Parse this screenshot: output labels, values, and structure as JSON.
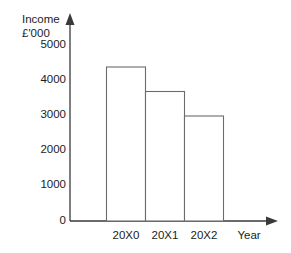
{
  "chart_data": {
    "type": "bar",
    "title": "",
    "subtitle": "",
    "xlabel": "Year",
    "ylabel": "Income",
    "ylabel_units": "£'000",
    "categories": [
      "20X0",
      "20X1",
      "20X2"
    ],
    "values": [
      4400,
      3700,
      3000
    ],
    "series": [
      {
        "name": "Income",
        "values": [
          4400,
          3700,
          3000
        ]
      }
    ],
    "ylim": [
      0,
      5000
    ],
    "yticks": [
      0,
      1000,
      2000,
      3000,
      4000,
      5000
    ],
    "ytick_labels": [
      "0",
      "1000",
      "2000",
      "3000",
      "4000",
      "5000"
    ],
    "grid": false,
    "legend": false,
    "legend_position": "none",
    "bar_fill_color": "#ffffff",
    "bar_border_color": "#6b6b6b",
    "axis_color": "#3a3a3a",
    "text_color": "#1c1c1c",
    "background_color": "#ffffff",
    "axis_arrows": true,
    "bars_adjacent": true,
    "annotations": []
  }
}
